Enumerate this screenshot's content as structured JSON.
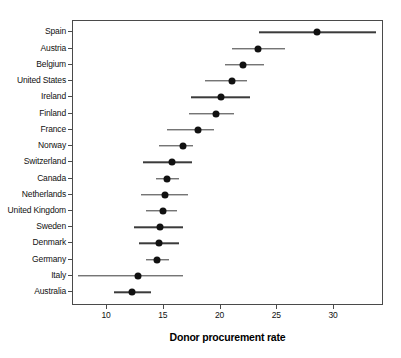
{
  "chart_data": {
    "type": "scatter",
    "subtype": "dot-plot-with-error-bars",
    "title": "",
    "xlabel": "Donor procurement rate",
    "ylabel": "",
    "xlim": [
      7.0,
      34.4
    ],
    "ylim": null,
    "grid": false,
    "legend": null,
    "xticks": [
      10,
      15,
      20,
      25,
      30
    ],
    "xtick_labels": [
      "10",
      "15",
      "20",
      "25",
      "30"
    ],
    "categories": [
      "Spain",
      "Austria",
      "Belgium",
      "United States",
      "Ireland",
      "Finland",
      "France",
      "Norway",
      "Switzerland",
      "Canada",
      "Netherlands",
      "United Kingdom",
      "Sweden",
      "Denmark",
      "Germany",
      "Italy",
      "Australia"
    ],
    "values": [
      28.5,
      23.3,
      22.0,
      21.0,
      20.0,
      19.6,
      18.0,
      16.7,
      15.7,
      15.3,
      15.1,
      14.9,
      14.7,
      14.6,
      14.4,
      12.7,
      12.2
    ],
    "ci_low": [
      23.4,
      21.0,
      20.4,
      18.6,
      17.4,
      17.2,
      15.3,
      14.6,
      13.2,
      14.3,
      13.0,
      13.4,
      12.4,
      12.8,
      13.4,
      7.4,
      10.6
    ],
    "ci_high": [
      33.7,
      25.7,
      23.8,
      22.3,
      22.6,
      21.2,
      19.4,
      17.6,
      17.5,
      16.3,
      17.1,
      16.2,
      16.7,
      16.3,
      15.5,
      16.7,
      13.9
    ],
    "series": [
      {
        "name": "Donor procurement rate (point estimate with 95% CI)",
        "points": [
          {
            "category": "Spain",
            "value": 28.5,
            "ci_low": 23.4,
            "ci_high": 33.7
          },
          {
            "category": "Austria",
            "value": 23.3,
            "ci_low": 21.0,
            "ci_high": 25.7
          },
          {
            "category": "Belgium",
            "value": 22.0,
            "ci_low": 20.4,
            "ci_high": 23.8
          },
          {
            "category": "United States",
            "value": 21.0,
            "ci_low": 18.6,
            "ci_high": 22.3
          },
          {
            "category": "Ireland",
            "value": 20.0,
            "ci_low": 17.4,
            "ci_high": 22.6
          },
          {
            "category": "Finland",
            "value": 19.6,
            "ci_low": 17.2,
            "ci_high": 21.2
          },
          {
            "category": "France",
            "value": 18.0,
            "ci_low": 15.3,
            "ci_high": 19.4
          },
          {
            "category": "Norway",
            "value": 16.7,
            "ci_low": 14.6,
            "ci_high": 17.6
          },
          {
            "category": "Switzerland",
            "value": 15.7,
            "ci_low": 13.2,
            "ci_high": 17.5
          },
          {
            "category": "Canada",
            "value": 15.3,
            "ci_low": 14.3,
            "ci_high": 16.3
          },
          {
            "category": "Netherlands",
            "value": 15.1,
            "ci_low": 13.0,
            "ci_high": 17.1
          },
          {
            "category": "United Kingdom",
            "value": 14.9,
            "ci_low": 13.4,
            "ci_high": 16.2
          },
          {
            "category": "Sweden",
            "value": 14.7,
            "ci_low": 12.4,
            "ci_high": 16.7
          },
          {
            "category": "Denmark",
            "value": 14.6,
            "ci_low": 12.8,
            "ci_high": 16.3
          },
          {
            "category": "Germany",
            "value": 14.4,
            "ci_low": 13.4,
            "ci_high": 15.5
          },
          {
            "category": "Italy",
            "value": 12.7,
            "ci_low": 7.4,
            "ci_high": 16.7
          },
          {
            "category": "Australia",
            "value": 12.2,
            "ci_low": 10.6,
            "ci_high": 13.9
          }
        ]
      }
    ],
    "colors": {
      "point": "#111111",
      "error_bar": "#3b3b3b",
      "axis": "#4a4a4a",
      "background": "#ffffff",
      "text": "#111111"
    }
  }
}
